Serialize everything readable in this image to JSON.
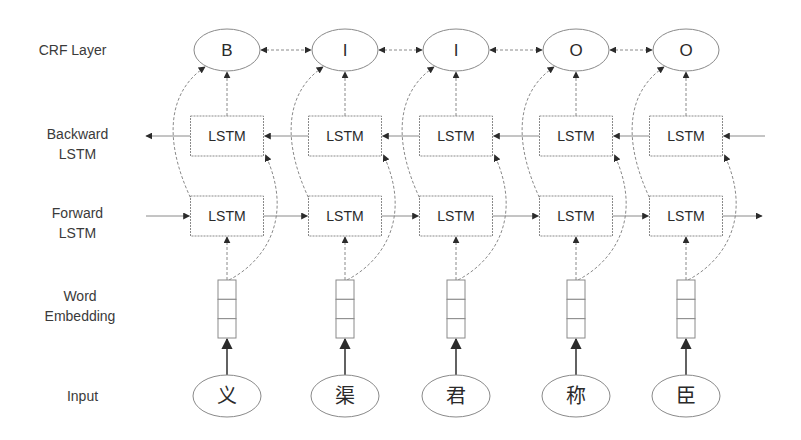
{
  "row_labels": {
    "crf": [
      "CRF Layer"
    ],
    "backward": [
      "Backward",
      "LSTM"
    ],
    "forward": [
      "Forward",
      "LSTM"
    ],
    "embedding": [
      "Word",
      "Embedding"
    ],
    "input": [
      "Input"
    ]
  },
  "columns": [
    {
      "cx": 227,
      "tag": "B",
      "backward": "LSTM",
      "forward": "LSTM",
      "embedding_cells": 3,
      "input": "义"
    },
    {
      "cx": 345,
      "tag": "I",
      "backward": "LSTM",
      "forward": "LSTM",
      "embedding_cells": 3,
      "input": "渠"
    },
    {
      "cx": 456,
      "tag": "I",
      "backward": "LSTM",
      "forward": "LSTM",
      "embedding_cells": 3,
      "input": "君"
    },
    {
      "cx": 576,
      "tag": "O",
      "backward": "LSTM",
      "forward": "LSTM",
      "embedding_cells": 3,
      "input": "称"
    },
    {
      "cx": 686,
      "tag": "O",
      "backward": "LSTM",
      "forward": "LSTM",
      "embedding_cells": 3,
      "input": "臣"
    }
  ],
  "colors": {
    "stroke": "#8a8a8a",
    "arrow": "#2b2b2b",
    "text": "#2a2a2a",
    "label": "#3a3a3a"
  }
}
